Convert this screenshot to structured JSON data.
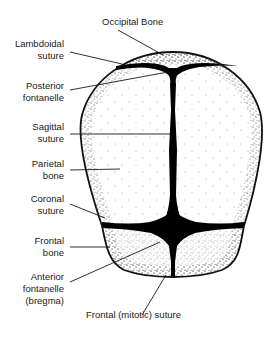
{
  "diagram": {
    "colors": {
      "outline": "#111111",
      "suture": "#000000",
      "stipple": "#222222",
      "background": "#ffffff",
      "leader": "#1a1a1a"
    },
    "labels": {
      "occipital_bone": "Occipital Bone",
      "lambdoidal_suture": "Lambdoidal\nsuture",
      "posterior_fontanelle": "Posterior\nfontanelle",
      "sagittal_suture": "Sagittal\nsuture",
      "parietal_bone": "Parietal\nbone",
      "coronal_suture": "Coronal\nsuture",
      "frontal_bone": "Frontal\nbone",
      "anterior_fontanelle": "Anterior\nfontanelle\n(bregma)",
      "frontal_suture": "Frontal (mitotic) suture"
    }
  }
}
